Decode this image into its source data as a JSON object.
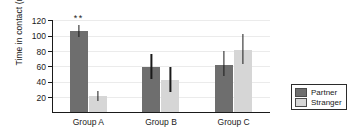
{
  "chart_data": {
    "type": "bar",
    "title": "",
    "subtitle": "",
    "xlabel": "",
    "ylabel": "Time in contact (min)",
    "categories": [
      "Group A",
      "Group B",
      "Group C"
    ],
    "series": [
      {
        "name": "Partner",
        "color": "#6e6e6e",
        "values": [
          105,
          58,
          61
        ],
        "err_upper": [
          113,
          75,
          79
        ],
        "err_lower": [
          97,
          43,
          46
        ]
      },
      {
        "name": "Stranger",
        "color": "#d6d6d6",
        "values": [
          20,
          41,
          80
        ],
        "err_upper": [
          27,
          58,
          101
        ],
        "err_lower": [
          14,
          25,
          62
        ]
      }
    ],
    "ylim": [
      0,
      120
    ],
    "yticks": [
      20,
      40,
      60,
      80,
      100,
      120
    ],
    "ytick_labels": [
      "20",
      "40",
      "60",
      "80",
      "100",
      "120"
    ],
    "grid": true,
    "grid_axis": "y",
    "legend_position": "right",
    "annotations": [
      {
        "text": "**",
        "category": "Group A",
        "series": "Partner",
        "meaning": "significance-marker"
      }
    ]
  },
  "legend": {
    "items": [
      {
        "label": "Partner",
        "color": "#6e6e6e"
      },
      {
        "label": "Stranger",
        "color": "#d6d6d6"
      }
    ]
  }
}
